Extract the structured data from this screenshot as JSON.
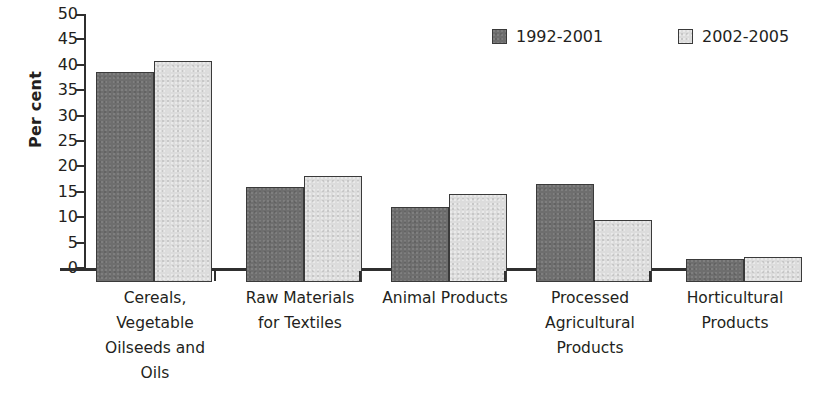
{
  "chart_data": {
    "type": "bar",
    "title": "",
    "xlabel": "",
    "ylabel": "Per cent",
    "ylim": [
      0,
      50
    ],
    "ytick_step": 5,
    "grid": false,
    "legend_position": "top-right",
    "categories": [
      "Cereals, Vegetable Oilseeds and Oils",
      "Raw Materials for Textiles",
      "Animal Products",
      "Processed Agricultural Products",
      "Horticultural Products"
    ],
    "category_lines": [
      [
        "Cereals,",
        "Vegetable",
        "Oilseeds and",
        "Oils"
      ],
      [
        "Raw Materials",
        "for Textiles"
      ],
      [
        "Animal Products"
      ],
      [
        "Processed",
        "Agricultural",
        "Products"
      ],
      [
        "Horticultural",
        "Products"
      ]
    ],
    "yticks": [
      "50",
      "45",
      "40",
      "35",
      "30",
      "25",
      "20",
      "15",
      "10",
      "5",
      "0"
    ],
    "ytick_values": [
      50,
      45,
      40,
      35,
      30,
      25,
      20,
      15,
      10,
      5,
      0
    ],
    "series": [
      {
        "name": "1992-2001",
        "color": "#6e6e6e",
        "values": [
          41.3,
          18.8,
          14.7,
          19.3,
          4.6
        ]
      },
      {
        "name": "2002-2005",
        "color": "#dcdcdc",
        "values": [
          43.6,
          20.8,
          17.3,
          12.2,
          4.9
        ]
      }
    ]
  },
  "legend": {
    "entries": [
      {
        "label": "1992-2001",
        "color": "#6e6e6e"
      },
      {
        "label": "2002-2005",
        "color": "#dcdcdc"
      }
    ]
  },
  "axis": {
    "y_label": "Per cent"
  }
}
